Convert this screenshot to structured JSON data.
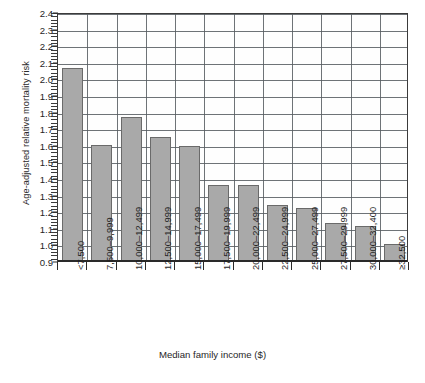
{
  "chart_data": {
    "type": "bar",
    "title": "",
    "xlabel": "Median family income ($)",
    "ylabel": "Age-adjusted relative mortality risk",
    "ylim": [
      0.9,
      2.4
    ],
    "ytick_step": 0.1,
    "yticks": [
      "2.4",
      "2.3",
      "2.2",
      "2.1",
      "2.0",
      "1.9",
      "1.8",
      "1.7",
      "1.6",
      "1.5",
      "1.4",
      "1.3",
      "1.2",
      "1.1",
      "1.0",
      "0.9"
    ],
    "grid": true,
    "legend": "none",
    "categories": [
      "<7,500",
      "7,500–9,999",
      "10,000–12,499",
      "12,500–14,999",
      "15,000–17,499",
      "17,500–19,999",
      "20,000–22,499",
      "22,500–24,999",
      "25,000–27,499",
      "27,500–29,999",
      "30,000–32,400",
      "≥32,500"
    ],
    "values": [
      2.06,
      1.6,
      1.77,
      1.65,
      1.59,
      1.36,
      1.36,
      1.24,
      1.22,
      1.13,
      1.11,
      1.0
    ],
    "bar_color": "#a9a9a9",
    "bar_edge_color": "#6a6a6a",
    "axis_color": "#2a2a2a",
    "grid_color": "#555a5f"
  },
  "footnote": ""
}
